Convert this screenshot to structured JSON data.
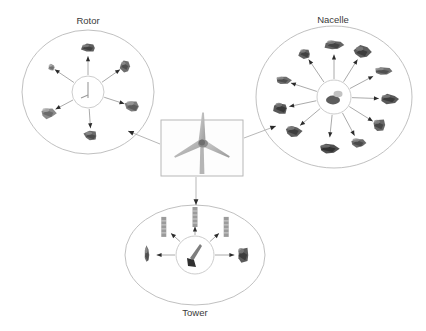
{
  "diagram": {
    "background_color": "#ffffff",
    "outline_color": "#b9b9b9",
    "spoke_color": "#8e8e8e",
    "arrow_color": "#2b2b2b",
    "label_color": "#3a3a3a",
    "center": {
      "name": "wind-turbine",
      "caption": "",
      "box": {
        "x": 161,
        "y": 120,
        "width": 82,
        "height": 56
      }
    },
    "groups": [
      {
        "id": "rotor",
        "label": "Rotor",
        "label_x": 88,
        "label_y": 21,
        "shape": "circle",
        "cx": 88,
        "cy": 92,
        "rx": 66,
        "ry": 62,
        "hub_r": 16,
        "part_count": 6,
        "parts": [
          {
            "name": "blade-root-section",
            "angle": -90,
            "dist": 44,
            "w": 17,
            "h": 9,
            "shade": "#5f5f5f"
          },
          {
            "name": "pitch-bearing",
            "angle": -35,
            "dist": 45,
            "w": 11,
            "h": 12,
            "shade": "#6e6e6e"
          },
          {
            "name": "hub-casting",
            "angle": 18,
            "dist": 47,
            "w": 18,
            "h": 14,
            "shade": "#7b7b7b"
          },
          {
            "name": "spinner-nose-cone",
            "angle": 86,
            "dist": 44,
            "w": 16,
            "h": 11,
            "shade": "#6b6b6b"
          },
          {
            "name": "blade-tip",
            "angle": 152,
            "dist": 45,
            "w": 17,
            "h": 13,
            "shade": "#8a8a8a"
          },
          {
            "name": "pitch-actuator",
            "angle": -146,
            "dist": 44,
            "w": 8,
            "h": 8,
            "shade": "#8f8f8f"
          }
        ]
      },
      {
        "id": "nacelle",
        "label": "Nacelle",
        "label_x": 333,
        "label_y": 20,
        "shape": "circle",
        "cx": 334,
        "cy": 97,
        "rx": 78,
        "ry": 71,
        "hub_r": 17,
        "part_count": 11,
        "parts": [
          {
            "name": "gearbox",
            "angle": -90,
            "dist": 52,
            "w": 20,
            "h": 12,
            "shade": "#636363"
          },
          {
            "name": "generator",
            "angle": -58,
            "dist": 53,
            "w": 18,
            "h": 14,
            "shade": "#5c5c5c"
          },
          {
            "name": "heat-exchanger",
            "angle": -28,
            "dist": 55,
            "w": 22,
            "h": 9,
            "shade": "#707070"
          },
          {
            "name": "main-shaft",
            "angle": 2,
            "dist": 55,
            "w": 21,
            "h": 11,
            "shade": "#5a5a5a"
          },
          {
            "name": "yaw-drive",
            "angle": 32,
            "dist": 53,
            "w": 15,
            "h": 14,
            "shade": "#666666"
          },
          {
            "name": "control-cabinet",
            "angle": 62,
            "dist": 52,
            "w": 17,
            "h": 12,
            "shade": "#6a6a6a"
          },
          {
            "name": "nacelle-bedplate",
            "angle": 96,
            "dist": 52,
            "w": 24,
            "h": 11,
            "shade": "#4f4f4f"
          },
          {
            "name": "transformer-unit",
            "angle": 140,
            "dist": 53,
            "w": 18,
            "h": 13,
            "shade": "#5e5e5e"
          },
          {
            "name": "brake-caliper",
            "angle": 168,
            "dist": 54,
            "w": 17,
            "h": 14,
            "shade": "#585858"
          },
          {
            "name": "coupling",
            "angle": -162,
            "dist": 54,
            "w": 18,
            "h": 9,
            "shade": "#6d6d6d"
          },
          {
            "name": "bearing-housing",
            "angle": -124,
            "dist": 52,
            "w": 14,
            "h": 12,
            "shade": "#616161"
          }
        ]
      },
      {
        "id": "tower",
        "label": "Tower",
        "label_x": 195,
        "label_y": 313,
        "shape": "ellipse",
        "cx": 195,
        "cy": 255,
        "rx": 70,
        "ry": 50,
        "hub_r": 19,
        "part_count": 5,
        "parts": [
          {
            "name": "tower-section-upper",
            "angle": -90,
            "dist": 38,
            "w": 5,
            "h": 20,
            "shade": "#8a8a8a"
          },
          {
            "name": "tower-section-middle",
            "angle": -42,
            "dist": 42,
            "w": 5,
            "h": 20,
            "shade": "#8a8a8a"
          },
          {
            "name": "tower-section-lower",
            "angle": -138,
            "dist": 42,
            "w": 5,
            "h": 20,
            "shade": "#8a8a8a"
          },
          {
            "name": "tower-door-assembly",
            "angle": 0,
            "dist": 48,
            "w": 14,
            "h": 18,
            "shade": "#5b5b5b"
          },
          {
            "name": "tower-flange",
            "angle": 180,
            "dist": 48,
            "w": 6,
            "h": 20,
            "shade": "#6f6f6f"
          }
        ]
      }
    ],
    "connectors": [
      {
        "name": "connector-center-to-rotor",
        "from": "center",
        "to": "rotor",
        "x1": 160,
        "y1": 144,
        "x2": 128,
        "y2": 131
      },
      {
        "name": "connector-center-to-nacelle",
        "from": "center",
        "to": "nacelle",
        "x1": 244,
        "y1": 138,
        "x2": 276,
        "y2": 126
      },
      {
        "name": "connector-center-to-tower",
        "from": "center",
        "to": "tower",
        "x1": 196,
        "y1": 177,
        "x2": 196,
        "y2": 205
      }
    ]
  }
}
